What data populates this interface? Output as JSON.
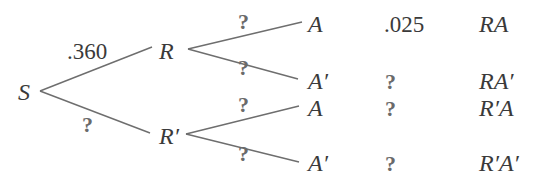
{
  "diagram": {
    "type": "probability-tree",
    "root": {
      "label": "S"
    },
    "level1": [
      {
        "label": "R",
        "edge_prob": ".360"
      },
      {
        "label": "R′",
        "edge_prob": "?"
      }
    ],
    "level2": [
      {
        "parent": "R",
        "label": "A",
        "edge_prob": "?",
        "joint_prob": ".025",
        "outcome": "RA"
      },
      {
        "parent": "R",
        "label": "A′",
        "edge_prob": "?",
        "joint_prob": "?",
        "outcome": "RA′"
      },
      {
        "parent": "R′",
        "label": "A",
        "edge_prob": "?",
        "joint_prob": "?",
        "outcome": "R′A"
      },
      {
        "parent": "R′",
        "label": "A′",
        "edge_prob": "?",
        "joint_prob": "?",
        "outcome": "R′A′"
      }
    ],
    "colors": {
      "edge": "#6e6e6e",
      "text": "#3a3a3a",
      "unknown": "#6a6a6a",
      "background": "#ffffff"
    }
  }
}
